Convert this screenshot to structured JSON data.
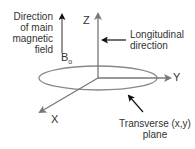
{
  "diagram": {
    "field_label": [
      "Direction",
      "of main",
      "magnetic",
      "field"
    ],
    "b0_symbol": "B",
    "b0_subscript": "o",
    "axes": {
      "z": "Z",
      "y": "Y",
      "x": "X"
    },
    "longitudinal_label": [
      "Longitudinal",
      "direction"
    ],
    "transverse_label": [
      "Transverse (x,y)",
      "plane"
    ],
    "colors": {
      "axis": "#777777",
      "arrow": "#111111",
      "text": "#333333"
    }
  }
}
